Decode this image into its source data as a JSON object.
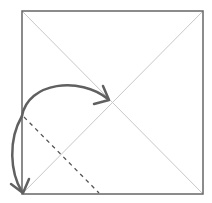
{
  "diagram": {
    "type": "origami-fold-step",
    "colors": {
      "background": "#ffffff",
      "paper_edge": "#666666",
      "crease": "#c8c8c8",
      "valley_fold": "#555555",
      "arrow": "#606060"
    },
    "square": {
      "x1": 22,
      "y1": 11,
      "x2": 203,
      "y2": 194
    },
    "center": {
      "x": 112,
      "y": 102
    },
    "creases": [
      {
        "name": "diagonal-tl-br",
        "x1": 22,
        "y1": 11,
        "x2": 203,
        "y2": 194
      },
      {
        "name": "diagonal-bl-tr",
        "x1": 22,
        "y1": 194,
        "x2": 203,
        "y2": 11
      }
    ],
    "valley_fold": {
      "x1": 23,
      "y1": 116,
      "x2": 99,
      "y2": 194,
      "style": "dashed"
    },
    "arrows": [
      {
        "name": "fold-arrow",
        "from": "left-edge",
        "to": "center",
        "path": "M 22 116 C 30 80, 80 75, 107 97"
      },
      {
        "name": "unfold-arrow",
        "from": "left-edge",
        "to": "bottom-left-corner",
        "path": "M 22 116 C 8 140, 10 175, 22 193"
      }
    ]
  }
}
